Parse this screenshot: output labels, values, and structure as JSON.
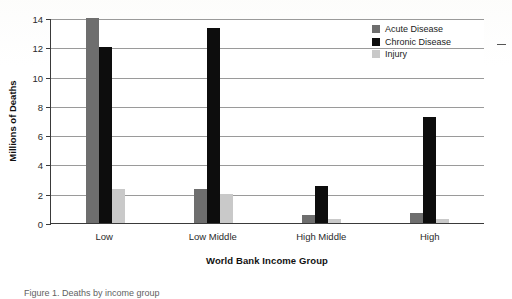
{
  "chart_data": {
    "type": "bar",
    "title": "",
    "xlabel": "World Bank Income Group",
    "ylabel": "Millions of Deaths",
    "categories": [
      "Low",
      "Low Middle",
      "High Middle",
      "High"
    ],
    "series": [
      {
        "name": "Acute Disease",
        "color": "#6e6e6e",
        "values": [
          14.0,
          2.3,
          0.55,
          0.65
        ]
      },
      {
        "name": "Chronic Disease",
        "color": "#0d0d0d",
        "values": [
          12.0,
          13.35,
          2.55,
          7.25
        ]
      },
      {
        "name": "Injury",
        "color": "#c9c9c9",
        "values": [
          2.3,
          2.0,
          0.3,
          0.3
        ]
      }
    ],
    "ylim": [
      0,
      14
    ],
    "yticks": [
      0,
      2,
      4,
      6,
      8,
      10,
      12,
      14
    ],
    "ytick_labels": [
      "0",
      "2",
      "4",
      "6",
      "8",
      "10",
      "12",
      "14"
    ],
    "grid": true,
    "grid_axis": "y",
    "legend_position": "top-right",
    "bar_group_order": [
      "Acute Disease",
      "Chronic Disease",
      "Injury"
    ]
  },
  "axes": {
    "y_title": "Millions of Deaths",
    "x_title": "World Bank Income Group"
  },
  "legend": {
    "items": [
      {
        "label": "Acute Disease",
        "swatch": "acute"
      },
      {
        "label": "Chronic Disease",
        "swatch": "chronic"
      },
      {
        "label": "Injury",
        "swatch": "injury"
      }
    ]
  },
  "caption": {
    "text": "Figure 1. Deaths by income group"
  }
}
